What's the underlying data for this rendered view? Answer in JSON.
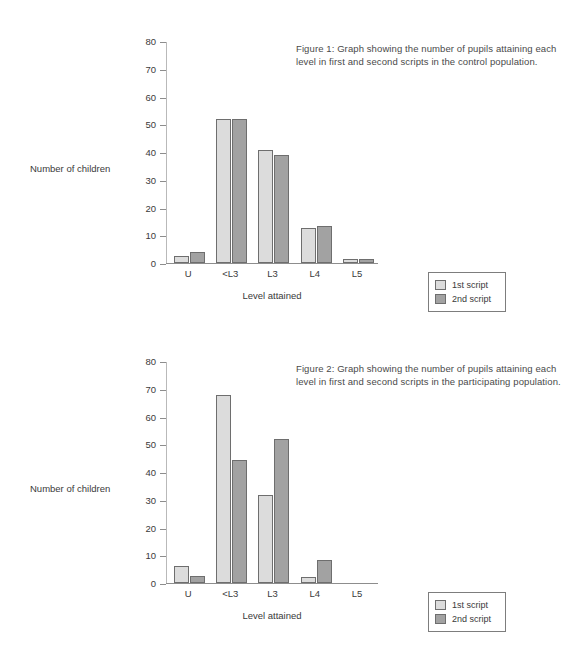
{
  "colors": {
    "series1": "#dcdcdc",
    "series2": "#a2a2a2",
    "bar_outline": "#6e6e6e",
    "axis": "#8d8d8d",
    "text": "#3a3a3a"
  },
  "legend": {
    "series1_label": "1st script",
    "series2_label": "2nd script"
  },
  "figure1": {
    "caption": "Figure 1: Graph showing the number of pupils attaining each level in first and second scripts in the control population.",
    "ylabel": "Number of children",
    "xlabel": "Level attained"
  },
  "figure2": {
    "caption": "Figure 2: Graph showing the number of pupils attaining each level in first and second scripts in the participating population.",
    "ylabel": "Number of children",
    "xlabel": "Level attained"
  },
  "chart_data": [
    {
      "type": "bar",
      "title": "Figure 1: Graph showing the number of pupils attaining each level in first and second scripts in the control population.",
      "xlabel": "Level attained",
      "ylabel": "Number of children",
      "categories": [
        "U",
        "<L3",
        "L3",
        "L4",
        "L5"
      ],
      "series": [
        {
          "name": "1st script",
          "values": [
            2.5,
            52,
            41,
            12.5,
            1.5
          ]
        },
        {
          "name": "2nd script",
          "values": [
            4,
            52,
            39,
            13.5,
            1.5
          ]
        }
      ],
      "ylim": [
        0,
        80
      ],
      "yticks": [
        0,
        10,
        20,
        30,
        40,
        50,
        60,
        70,
        80
      ],
      "grid": false,
      "legend_position": "right-outside"
    },
    {
      "type": "bar",
      "title": "Figure 2: Graph showing the number of pupils attaining each level in first and second scripts in the participating population.",
      "xlabel": "Level attained",
      "ylabel": "Number of children",
      "categories": [
        "U",
        "<L3",
        "L3",
        "L4",
        "L5"
      ],
      "series": [
        {
          "name": "1st script",
          "values": [
            6,
            68,
            32,
            2,
            0
          ]
        },
        {
          "name": "2nd script",
          "values": [
            2.5,
            44.5,
            52,
            8.5,
            0
          ]
        }
      ],
      "ylim": [
        0,
        80
      ],
      "yticks": [
        0,
        10,
        20,
        30,
        40,
        50,
        60,
        70,
        80
      ],
      "grid": false,
      "legend_position": "right-outside"
    }
  ]
}
